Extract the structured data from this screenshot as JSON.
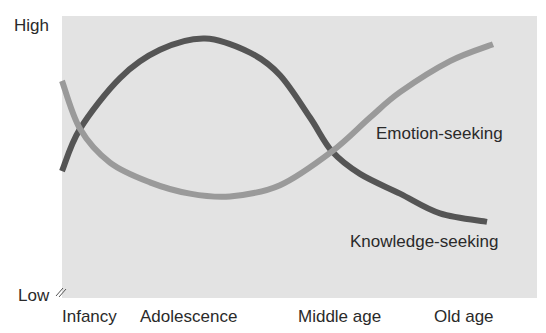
{
  "chart_data": {
    "type": "line",
    "title": "",
    "xlabel": "",
    "ylabel": "",
    "y_tick_labels": {
      "high": "High",
      "low": "Low"
    },
    "ylim": [
      0,
      100
    ],
    "categories": [
      "Infancy",
      "Adolescence",
      "Middle age",
      "Old age"
    ],
    "category_positions_px": [
      94,
      197,
      348,
      469
    ],
    "grid": false,
    "legend": "inline labels",
    "series": [
      {
        "name": "Knowledge-seeking",
        "color": "#555555",
        "label_pos": {
          "x": 350,
          "y": 232
        },
        "points": [
          {
            "x": 62,
            "y": 45
          },
          {
            "x": 80,
            "y": 60
          },
          {
            "x": 120,
            "y": 78
          },
          {
            "x": 160,
            "y": 88
          },
          {
            "x": 205,
            "y": 92
          },
          {
            "x": 250,
            "y": 87
          },
          {
            "x": 280,
            "y": 79
          },
          {
            "x": 310,
            "y": 64
          },
          {
            "x": 332,
            "y": 52
          },
          {
            "x": 360,
            "y": 44
          },
          {
            "x": 400,
            "y": 37
          },
          {
            "x": 440,
            "y": 30
          },
          {
            "x": 487,
            "y": 27
          }
        ]
      },
      {
        "name": "Emotion-seeking",
        "color": "#9a9a9a",
        "label_pos": {
          "x": 376,
          "y": 124
        },
        "points": [
          {
            "x": 62,
            "y": 77
          },
          {
            "x": 80,
            "y": 60
          },
          {
            "x": 110,
            "y": 48
          },
          {
            "x": 150,
            "y": 41
          },
          {
            "x": 190,
            "y": 37
          },
          {
            "x": 230,
            "y": 36
          },
          {
            "x": 280,
            "y": 40
          },
          {
            "x": 332,
            "y": 52
          },
          {
            "x": 370,
            "y": 64
          },
          {
            "x": 400,
            "y": 73
          },
          {
            "x": 450,
            "y": 84
          },
          {
            "x": 493,
            "y": 90
          }
        ]
      }
    ]
  },
  "colors": {
    "plot_background": "#e3e3e3",
    "text": "#2a2a2a"
  }
}
